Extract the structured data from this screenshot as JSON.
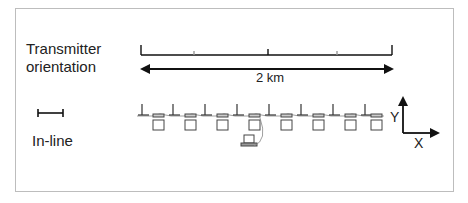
{
  "labels": {
    "transmitter_line1": "Transmitter",
    "transmitter_line2": "orientation",
    "inline": "In-line",
    "distance": "2 km",
    "axis_x": "X",
    "axis_y": "Y"
  },
  "diagram": {
    "scale_bar_ticks": 5,
    "receiver_count": 8,
    "transmitter_count": 8,
    "colors": {
      "line": "#111111",
      "device": "#555555",
      "frame": "#bdbdbd"
    }
  }
}
